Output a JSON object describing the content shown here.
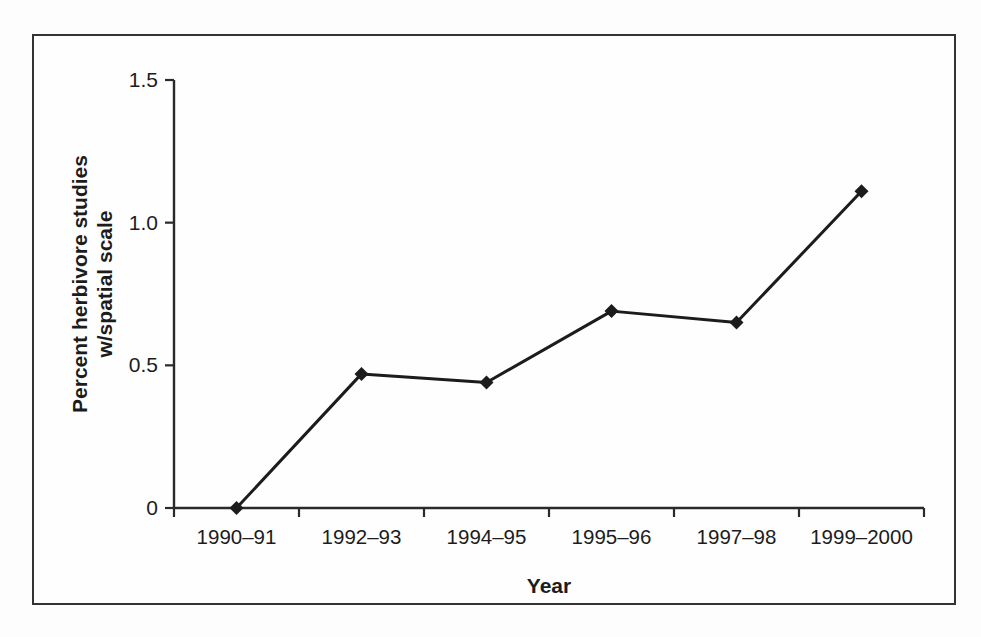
{
  "chart_data": {
    "type": "line",
    "categories": [
      "1990–91",
      "1992–93",
      "1994–95",
      "1995–96",
      "1997–98",
      "1999–2000"
    ],
    "values": [
      0,
      0.47,
      0.44,
      0.69,
      0.65,
      1.11
    ],
    "title": "",
    "xlabel": "Year",
    "ylabel": "Percent herbivore studies w/spatial scale",
    "ylabel_lines": [
      "Percent herbivore studies",
      "w/spatial scale"
    ],
    "ylim": [
      0,
      1.5
    ],
    "yticks": [
      0,
      0.5,
      1.0,
      1.5
    ],
    "ytick_labels": [
      "0",
      "0.5",
      "1.0",
      "1.5"
    ],
    "grid": false,
    "legend": "none",
    "marker": "diamond",
    "colors": {
      "line": "#1c1c1c",
      "axis": "#2a2a2a",
      "text": "#1c1c1c",
      "frame_border": "#333333",
      "background": "#fefefe"
    }
  }
}
